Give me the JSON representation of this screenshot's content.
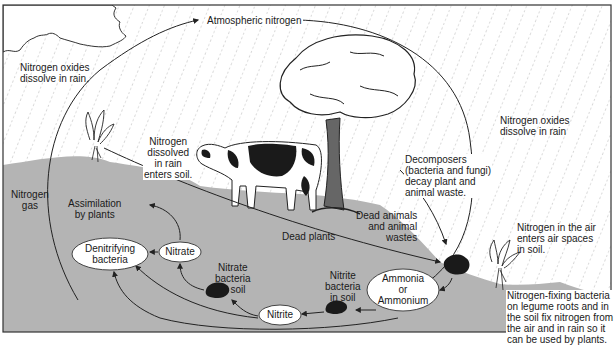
{
  "diagram": {
    "colors": {
      "sky": "#ffffff",
      "rain_dash": "#9a9a9a",
      "soil": "#b4b4b4",
      "frame": "#333333",
      "arrow": "#222222",
      "oval_fill": "#ffffff",
      "bacteria_blob": "#1a1a1a"
    },
    "labels": {
      "atmospheric_nitrogen": "Atmospheric nitrogen",
      "nitrogen_oxides_left": "Nitrogen oxides\ndissolve in rain.",
      "nitrogen_oxides_right": "Nitrogen oxides\ndissolve in rain",
      "nitrogen_dissolved": "Nitrogen\ndissolved\nin rain\nenters soil.",
      "nitrogen_gas": "Nitrogen\ngas",
      "assimilation": "Assimilation\nby plants",
      "decomposers": "Decomposers\n(bacteria and fungi)\ndecay plant and\nanimal waste.",
      "dead_animals": "Dead animals\nand animal\nwastes",
      "dead_plants": "Dead plants",
      "nitrogen_in_air": "Nitrogen in the air\nenters air spaces\nin soil.",
      "nitrate_bacteria": "Nitrate\nbacteria\nin soil",
      "nitrite_bacteria": "Nitrite\nbacteria\nin soil",
      "nitrogen_fixing": "Nitrogen-fixing bacteria\non legume roots and in\nthe soil fix nitrogen from\nthe air and in rain so it\ncan be used by plants."
    },
    "nodes": {
      "denitrifying": "Denitrifying\nbacteria",
      "nitrate": "Nitrate",
      "nitrite": "Nitrite",
      "ammonia": "Ammonia\nor\nAmmonium"
    },
    "icons": [
      "cloud-icon",
      "tree-icon",
      "cow-icon",
      "plant-icon",
      "legume-plant-icon",
      "bacteria-blob-icon"
    ]
  }
}
